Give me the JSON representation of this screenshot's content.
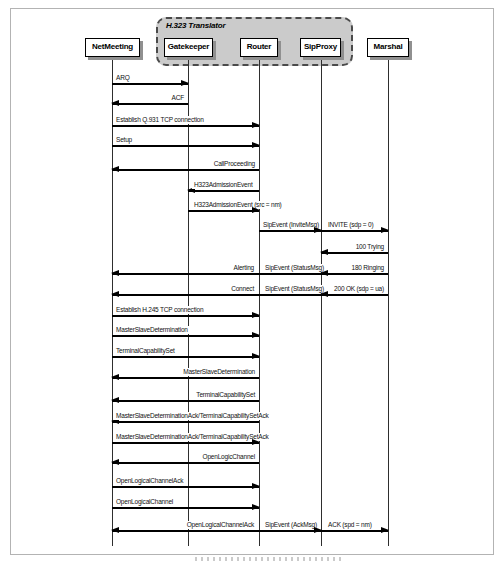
{
  "diagram": {
    "translator": {
      "label": "H.323 Translator"
    },
    "participants": [
      {
        "name": "NetMeeting"
      },
      {
        "name": "Gatekeeper"
      },
      {
        "name": "Router"
      },
      {
        "name": "SipProxy"
      },
      {
        "name": "Marshal"
      }
    ],
    "colors": {
      "line": "#000000",
      "translator_fill": "#cbcbcb",
      "box_shadow": "#909090",
      "figure_border": "#b3b3b3"
    },
    "messages": [
      {
        "label": "ARQ",
        "from": "NetMeeting",
        "to": "Gatekeeper"
      },
      {
        "label": "ACF",
        "from": "Gatekeeper",
        "to": "NetMeeting"
      },
      {
        "label": "Establish Q.931 TCP connection",
        "from": "NetMeeting",
        "to": "Router"
      },
      {
        "label": "Setup",
        "from": "NetMeeting",
        "to": "Router"
      },
      {
        "label": "CallProceeding",
        "from": "Router",
        "to": "NetMeeting"
      },
      {
        "label": "H323AdmissionEvent",
        "from": "Router",
        "to": "Gatekeeper"
      },
      {
        "label": "H323AdmissionEvent (src = nm)",
        "from": "Gatekeeper",
        "to": "Router"
      },
      {
        "label": "SipEvent (InviteMsg)",
        "from": "Router",
        "to": "SipProxy"
      },
      {
        "label": "INVITE (sdp = 0)",
        "from": "SipProxy",
        "to": "Marshal"
      },
      {
        "label": "100 Trying",
        "from": "Marshal",
        "to": "SipProxy"
      },
      {
        "label": "Alerting",
        "from": "Router",
        "to": "NetMeeting"
      },
      {
        "label": "SipEvent (StatusMsg)",
        "from": "SipProxy",
        "to": "Router"
      },
      {
        "label": "180 Ringing",
        "from": "Marshal",
        "to": "SipProxy"
      },
      {
        "label": "Connect",
        "from": "Router",
        "to": "NetMeeting"
      },
      {
        "label": "SipEvent (StatusMsg)",
        "from": "SipProxy",
        "to": "Router"
      },
      {
        "label": "200 OK (sdp = ua)",
        "from": "Marshal",
        "to": "SipProxy"
      },
      {
        "label": "Establish H.245 TCP connection",
        "from": "NetMeeting",
        "to": "Router"
      },
      {
        "label": "MasterSlaveDetermination",
        "from": "NetMeeting",
        "to": "Router"
      },
      {
        "label": "TerminalCapabilitySet",
        "from": "NetMeeting",
        "to": "Router"
      },
      {
        "label": "MasterSlaveDetermination",
        "from": "Router",
        "to": "NetMeeting"
      },
      {
        "label": "TerminalCapabilitySet",
        "from": "Router",
        "to": "NetMeeting"
      },
      {
        "label": "MasterSlaveDeterminationAck/TerminalCapabilitySetAck",
        "from": "Router",
        "to": "NetMeeting"
      },
      {
        "label": "MasterSlaveDeterminationAck/TerminalCapabilitySetAck",
        "from": "NetMeeting",
        "to": "Router"
      },
      {
        "label": "OpenLogicChannel",
        "from": "Router",
        "to": "NetMeeting"
      },
      {
        "label": "OpenLogicalChannelAck",
        "from": "NetMeeting",
        "to": "Router"
      },
      {
        "label": "OpenLogicalChannel",
        "from": "NetMeeting",
        "to": "Router"
      },
      {
        "label": "OpenLogicalChannelAck",
        "from": "Router",
        "to": "NetMeeting"
      },
      {
        "label": "SipEvent (AckMsg)",
        "from": "Router",
        "to": "SipProxy"
      },
      {
        "label": "ACK (spd = nm)",
        "from": "SipProxy",
        "to": "Marshal"
      }
    ]
  }
}
